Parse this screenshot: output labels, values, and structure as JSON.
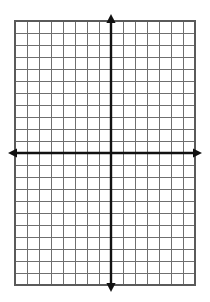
{
  "page": {
    "background_color": "#ffffff",
    "width": 210,
    "height": 302
  },
  "grid": {
    "label": "graph-paper-grid",
    "line_color": "#6f6f6f",
    "border_color": "#5a5a5a",
    "cell_size": 12,
    "columns": 15,
    "rows": 22,
    "left": 15,
    "top": 21,
    "right": 195,
    "bottom": 285
  },
  "axes": {
    "color": "#111111",
    "origin_x": 111,
    "origin_y": 153,
    "x_axis": {
      "label": "x-axis",
      "start_x": 8,
      "end_x": 202,
      "y": 153,
      "arrow_left": true,
      "arrow_right": true
    },
    "y_axis": {
      "label": "y-axis",
      "x": 111,
      "start_y": 14,
      "end_y": 292,
      "arrow_up": true,
      "arrow_down": true
    }
  },
  "chart_data": {
    "type": "scatter",
    "title": "",
    "xlabel": "",
    "ylabel": "",
    "series": [],
    "x": [],
    "values": [],
    "xlim": [
      -8,
      7
    ],
    "ylim": [
      -11,
      11
    ],
    "grid": true,
    "gridlines_x": 15,
    "gridlines_y": 22,
    "legend": "none",
    "annotations": [],
    "tick_labels_x": [],
    "tick_labels_y": []
  }
}
